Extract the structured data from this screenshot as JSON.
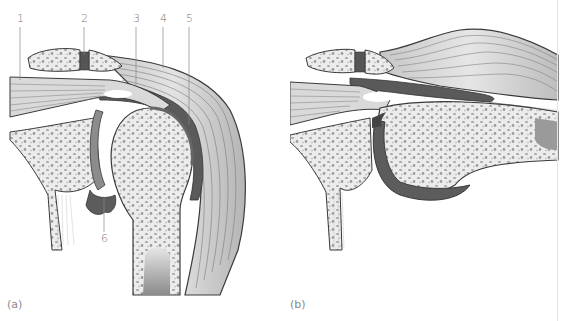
{
  "figure": {
    "panels": [
      {
        "id": "a",
        "caption": "(a)",
        "description": "Normal shoulder joint, coronal section",
        "labels": [
          {
            "number": "1",
            "x": 17,
            "y": 14
          },
          {
            "number": "2",
            "x": 81,
            "y": 14
          },
          {
            "number": "3",
            "x": 133,
            "y": 14
          },
          {
            "number": "4",
            "x": 160,
            "y": 14
          },
          {
            "number": "5",
            "x": 186,
            "y": 14
          },
          {
            "number": "6",
            "x": 101,
            "y": 234
          }
        ]
      },
      {
        "id": "b",
        "caption": "(b)",
        "description": "Shoulder joint with arm abducted; impingement of subacromial structures"
      }
    ],
    "colors": {
      "bone_fill": "#e9e9e9",
      "bone_pore": "#9a9a9a",
      "muscle_fill": "#d4d4d4",
      "muscle_line": "#7a7a7a",
      "dark_tissue": "#555555",
      "cartilage": "#8c8c8c",
      "outline": "#3a3a3a",
      "label_text": "#777777"
    }
  }
}
